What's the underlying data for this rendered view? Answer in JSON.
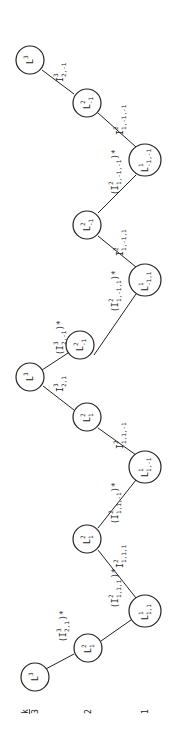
{
  "axis": {
    "title": "k",
    "levels": [
      "3",
      "2",
      "1"
    ]
  },
  "nodes": [
    {
      "id": "n0",
      "base": "L",
      "sup": "3",
      "sub": "",
      "level": 3
    },
    {
      "id": "n1",
      "base": "L",
      "sup": "2",
      "sub": "1",
      "level": 2
    },
    {
      "id": "n2",
      "base": "L",
      "sup": "1",
      "sub": "1,1",
      "level": 1
    },
    {
      "id": "n3",
      "base": "L",
      "sup": "2",
      "sub": "1",
      "level": 2
    },
    {
      "id": "n4",
      "base": "L",
      "sup": "1",
      "sub": "1,-1",
      "level": 1
    },
    {
      "id": "n5",
      "base": "L",
      "sup": "2",
      "sub": "1",
      "level": 2
    },
    {
      "id": "n6",
      "base": "L",
      "sup": "3",
      "sub": "",
      "level": 3
    },
    {
      "id": "n7",
      "base": "L",
      "sup": "2",
      "sub": "-1",
      "level": 2
    },
    {
      "id": "n8",
      "base": "L",
      "sup": "1",
      "sub": "-1,1",
      "level": 1
    },
    {
      "id": "n9",
      "base": "L",
      "sup": "2",
      "sub": "-1",
      "level": 2
    },
    {
      "id": "n10",
      "base": "L",
      "sup": "1",
      "sub": "-1,-1",
      "level": 1
    },
    {
      "id": "n11",
      "base": "L",
      "sup": "2",
      "sub": "-1",
      "level": 2
    },
    {
      "id": "n12",
      "base": "L",
      "sup": "3",
      "sub": "",
      "level": 3
    }
  ],
  "edges": [
    {
      "label": "(I",
      "sup": "3",
      "sub": "2,1",
      "tail": ")*"
    },
    {
      "label": "(I",
      "sup": "2",
      "sub": "1,1,1",
      "tail": ")*"
    },
    {
      "label": "I",
      "sup": "2",
      "sub": "1,1,1",
      "tail": ""
    },
    {
      "label": "(I",
      "sup": "2",
      "sub": "1,1,-1",
      "tail": ")*"
    },
    {
      "label": "I",
      "sup": "2",
      "sub": "1,1,-1",
      "tail": ""
    },
    {
      "label": "I",
      "sup": "3",
      "sub": "2,1",
      "tail": ""
    },
    {
      "label": "(I",
      "sup": "3",
      "sub": "2,-1",
      "tail": ")*"
    },
    {
      "label": "(I",
      "sup": "2",
      "sub": "1,-1,1",
      "tail": ")*"
    },
    {
      "label": "I",
      "sup": "2",
      "sub": "1,-1,1",
      "tail": ""
    },
    {
      "label": "(I",
      "sup": "2",
      "sub": "1,-1,-1",
      "tail": ")*"
    },
    {
      "label": "I",
      "sup": "2",
      "sub": "1,-1,-1",
      "tail": ""
    },
    {
      "label": "I",
      "sup": "3",
      "sub": "2,-1",
      "tail": ""
    }
  ]
}
